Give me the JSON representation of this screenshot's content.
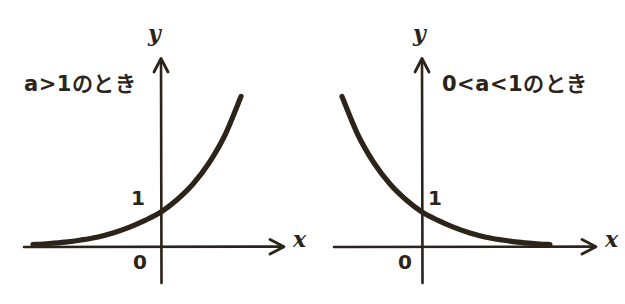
{
  "figure": {
    "background_color": "#ffffff",
    "ink_color": "#2c2319"
  },
  "panels": [
    {
      "id": "left",
      "caption": "a>1のとき",
      "x_axis_label": "x",
      "y_axis_label": "y",
      "y_intercept_label": "1",
      "origin_label": "0"
    },
    {
      "id": "right",
      "caption": "0<a<1のとき",
      "x_axis_label": "x",
      "y_axis_label": "y",
      "y_intercept_label": "1",
      "origin_label": "0"
    }
  ],
  "chart_data": [
    {
      "type": "line",
      "title": "a>1のとき",
      "function": "y = a^x, a > 1",
      "xlabel": "x",
      "ylabel": "y",
      "xlim": [
        -3.2,
        2.2
      ],
      "ylim": [
        -0.35,
        4.4
      ],
      "grid": false,
      "legend": null,
      "annotations": [
        "1",
        "0"
      ],
      "x": [
        -3.2,
        -2.8,
        -2.4,
        -2.0,
        -1.6,
        -1.2,
        -0.8,
        -0.4,
        0.0,
        0.4,
        0.8,
        1.2,
        1.6,
        2.0
      ],
      "y": [
        0.07,
        0.1,
        0.14,
        0.2,
        0.28,
        0.4,
        0.56,
        0.76,
        1.0,
        1.35,
        1.8,
        2.4,
        3.2,
        4.3
      ],
      "y_intercept": 1,
      "asymptote": "y = 0 (negative x direction)",
      "monotonic": "increasing"
    },
    {
      "type": "line",
      "title": "0<a<1のとき",
      "function": "y = a^x, 0 < a < 1",
      "xlabel": "x",
      "ylabel": "y",
      "xlim": [
        -2.2,
        3.2
      ],
      "ylim": [
        -0.35,
        4.4
      ],
      "grid": false,
      "legend": null,
      "annotations": [
        "1",
        "0"
      ],
      "x": [
        -2.0,
        -1.6,
        -1.2,
        -0.8,
        -0.4,
        0.0,
        0.4,
        0.8,
        1.2,
        1.6,
        2.0,
        2.4,
        2.8,
        3.2
      ],
      "y": [
        4.3,
        3.2,
        2.4,
        1.8,
        1.35,
        1.0,
        0.76,
        0.56,
        0.4,
        0.28,
        0.2,
        0.14,
        0.1,
        0.07
      ],
      "y_intercept": 1,
      "asymptote": "y = 0 (positive x direction)",
      "monotonic": "decreasing"
    }
  ]
}
